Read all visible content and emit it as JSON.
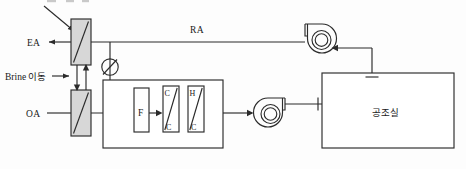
{
  "diagram": {
    "type": "hvac-schematic",
    "canvas": {
      "width": 466,
      "height": 169
    },
    "colors": {
      "line": "#2b2b2b",
      "hatch_fill": "#d7d7d7",
      "background": "#ffffff",
      "text": "#1a1a1a"
    },
    "labels": {
      "exhaust_air": "EA",
      "return_air": "RA",
      "outdoor_air": "OA",
      "brine": "Brine 이동",
      "room": "공조실",
      "filter": "F",
      "cooling_coil_top": "C",
      "cooling_coil_bottom": "C",
      "heating_coil_top": "H",
      "heating_coil_bottom": "C"
    },
    "components": [
      {
        "name": "exhaust-heat-exchanger",
        "label": "",
        "note": "hatched coil, upper left"
      },
      {
        "name": "intake-heat-exchanger",
        "label": "",
        "note": "hatched coil, lower left"
      },
      {
        "name": "damper-valve",
        "label": "",
        "note": "circle with diagonal stem"
      },
      {
        "name": "filter",
        "label": "F"
      },
      {
        "name": "cooling-coil",
        "label": "C/C"
      },
      {
        "name": "heating-coil",
        "label": "H/C"
      },
      {
        "name": "exhaust-fan",
        "label": ""
      },
      {
        "name": "supply-fan",
        "label": ""
      },
      {
        "name": "conditioned-room",
        "label": "공조실"
      }
    ],
    "flows": [
      {
        "from": "exhaust-heat-exchanger",
        "to": "EA",
        "direction": "left"
      },
      {
        "from": "exhaust-fan",
        "to": "exhaust-heat-exchanger",
        "label": "RA",
        "direction": "left"
      },
      {
        "from": "OA",
        "to": "intake-heat-exchanger",
        "direction": "right"
      },
      {
        "from": "intake-heat-exchanger",
        "to": "filter",
        "direction": "right"
      },
      {
        "from": "filter",
        "to": "cooling-coil",
        "direction": "right"
      },
      {
        "from": "heating-coil",
        "to": "supply-fan",
        "direction": "right"
      },
      {
        "from": "supply-fan",
        "to": "conditioned-room",
        "direction": "right"
      },
      {
        "from": "conditioned-room",
        "to": "exhaust-fan",
        "direction": "left"
      },
      {
        "from": "intake-heat-exchanger",
        "to": "exhaust-heat-exchanger",
        "label": "Brine 이동",
        "direction": "up"
      }
    ]
  }
}
